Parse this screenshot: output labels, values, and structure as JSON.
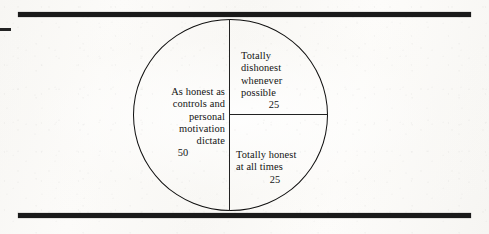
{
  "figure": {
    "background_color": "#fdfdfb",
    "ink_color": "#131313",
    "rule_color": "#1a1a1a"
  },
  "chart_data": {
    "type": "pie",
    "title": "",
    "subtitle": "",
    "xlabel": "",
    "ylabel": "",
    "legend_position": "none",
    "grid": false,
    "total": 100,
    "units": "percent",
    "categories": [
      "As honest as controls and personal motivation dictate",
      "Totally dishonest whenever possible",
      "Totally honest at all times"
    ],
    "values": [
      50,
      25,
      25
    ],
    "slices": [
      {
        "label": "As honest as\ncontrols and\npersonal\nmotivation\ndictate",
        "value": "50",
        "numeric_value": 50,
        "start_angle_deg": 180,
        "end_angle_deg": 360,
        "position": "left-half",
        "text_align": "right"
      },
      {
        "label": "Totally\ndishonest\nwhenever\npossible",
        "value": "25",
        "numeric_value": 25,
        "start_angle_deg": 0,
        "end_angle_deg": 90,
        "position": "top-right-quadrant",
        "text_align": "left"
      },
      {
        "label": "Totally honest\nat all times",
        "value": "25",
        "numeric_value": 25,
        "start_angle_deg": 90,
        "end_angle_deg": 180,
        "position": "bottom-right-quadrant",
        "text_align": "left"
      }
    ]
  }
}
